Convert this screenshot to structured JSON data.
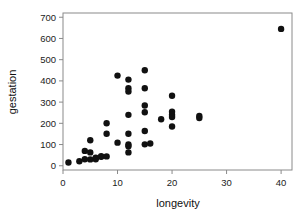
{
  "chart_data": {
    "type": "scatter",
    "title": "",
    "xlabel": "longevity",
    "ylabel": "gestation",
    "xlim": [
      0,
      42
    ],
    "ylim": [
      -20,
      720
    ],
    "xticks": [
      0,
      10,
      20,
      30,
      40
    ],
    "yticks": [
      0,
      100,
      200,
      300,
      400,
      500,
      600,
      700
    ],
    "xtick_labels": [
      "0",
      "10",
      "20",
      "30",
      "40"
    ],
    "ytick_labels": [
      "0",
      "100",
      "200",
      "300",
      "400",
      "500",
      "600",
      "700"
    ],
    "grid": false,
    "legend": null,
    "marker": {
      "shape": "circle",
      "color": "#111111",
      "size": 3.2
    },
    "points": [
      {
        "x": 1,
        "y": 15
      },
      {
        "x": 3,
        "y": 21
      },
      {
        "x": 4,
        "y": 70
      },
      {
        "x": 4,
        "y": 31
      },
      {
        "x": 5,
        "y": 120
      },
      {
        "x": 5,
        "y": 63
      },
      {
        "x": 5,
        "y": 30
      },
      {
        "x": 6,
        "y": 31
      },
      {
        "x": 6,
        "y": 38
      },
      {
        "x": 7,
        "y": 42
      },
      {
        "x": 7,
        "y": 45
      },
      {
        "x": 8,
        "y": 200
      },
      {
        "x": 8,
        "y": 151
      },
      {
        "x": 8,
        "y": 44
      },
      {
        "x": 10,
        "y": 425
      },
      {
        "x": 10,
        "y": 109
      },
      {
        "x": 12,
        "y": 406
      },
      {
        "x": 12,
        "y": 365
      },
      {
        "x": 12,
        "y": 350
      },
      {
        "x": 12,
        "y": 240
      },
      {
        "x": 12,
        "y": 151
      },
      {
        "x": 12,
        "y": 100
      },
      {
        "x": 12,
        "y": 92
      },
      {
        "x": 12,
        "y": 63
      },
      {
        "x": 15,
        "y": 450
      },
      {
        "x": 15,
        "y": 365
      },
      {
        "x": 15,
        "y": 284
      },
      {
        "x": 15,
        "y": 252
      },
      {
        "x": 15,
        "y": 164
      },
      {
        "x": 15,
        "y": 101
      },
      {
        "x": 16,
        "y": 105
      },
      {
        "x": 18,
        "y": 219
      },
      {
        "x": 20,
        "y": 330
      },
      {
        "x": 20,
        "y": 255
      },
      {
        "x": 20,
        "y": 240
      },
      {
        "x": 20,
        "y": 230
      },
      {
        "x": 20,
        "y": 185
      },
      {
        "x": 25,
        "y": 235
      },
      {
        "x": 25,
        "y": 225
      },
      {
        "x": 40,
        "y": 645
      }
    ]
  },
  "axes": {
    "x_axis_name": "longevity-axis",
    "y_axis_name": "gestation-axis"
  }
}
